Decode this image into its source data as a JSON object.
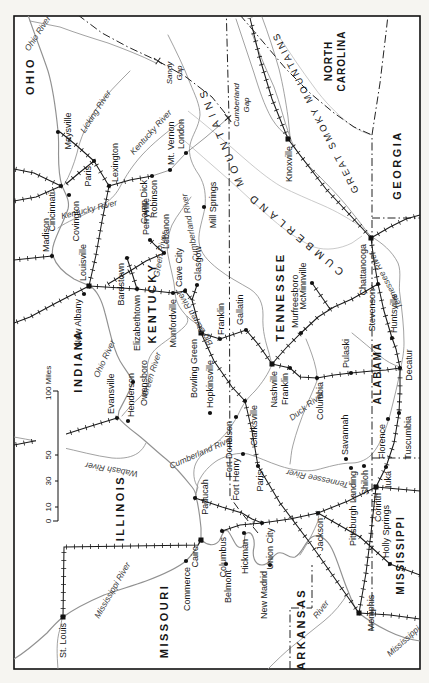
{
  "page": {
    "background": "#f6f5f1",
    "map_background": "#ffffff",
    "ink": "#1c1c1c",
    "river_ink": "#919191"
  },
  "states": {
    "ohio": "OHIO",
    "indiana": "INDIANA",
    "illinois": "ILLINOIS",
    "missouri": "MISSOURI",
    "arkansas": "ARKANSAS",
    "kentucky": "KENTUCKY",
    "tennessee": "TENNESSEE",
    "mississippi": "MISSISSIPPI",
    "alabama": "ALABAMA",
    "georgia": "GEORGIA",
    "north_carolina_1": "NORTH",
    "north_carolina_2": "CAROLINA"
  },
  "cities": {
    "st_louis": "St. Louis",
    "commerce": "Commerce",
    "cairo": "Cairo",
    "columbus": "Columbus",
    "belmont": "Belmont",
    "hickman": "Hickman",
    "union_city": "Union City",
    "new_madrid": "New Madrid",
    "paducah": "Paducah",
    "memphis": "Memphis",
    "fort_henry": "Fort Henry",
    "fort_donelson": "Fort Donelson",
    "paris_tn": "Paris",
    "jackson": "Jackson",
    "savannah": "Savannah",
    "pittsburgh_landing": "Pittsburgh Landing",
    "shiloh": "Shiloh",
    "corinth": "Corinth",
    "iuka": "Iuka",
    "holly_springs": "Holly Springs",
    "florence": "Florence",
    "tuscumbia": "Tuscumbia",
    "decatur": "Decatur",
    "huntsville": "Huntsville",
    "stevenson": "Stevenson",
    "chattanooga": "Chattanooga",
    "pulaski": "Pulaski",
    "columbia": "Columbia",
    "franklin_tn": "Franklin",
    "murfreesboro": "Murfreesboro",
    "mcminnville": "McMinnville",
    "nashville": "Nashville",
    "gallatin": "Gallatin",
    "franklin_ky": "Franklin",
    "clarksville": "Clarksville",
    "hopkinsville": "Hopkinsville",
    "bowling_green": "Bowling Green",
    "cave_city": "Cave City",
    "glasgow": "Glasgow",
    "munfordville": "Munfordville",
    "elizabethtown": "Elizabethtown",
    "louisville": "Louisville",
    "new_albany": "New Albany",
    "bardstown": "Bardstown",
    "perryville": "Perryville",
    "lebanon": "Lebanon",
    "owensboro": "Owensboro",
    "evansville": "Evansville",
    "henderson": "Henderson",
    "madison": "Madison",
    "cincinnati": "Cincinnati",
    "covington": "Covington",
    "maysville": "Maysville",
    "paris_ky": "Paris",
    "lexington": "Lexington",
    "camp_dick_1": "Camp Dick",
    "camp_dick_2": "Robinson",
    "mt_vernon": "Mt. Vernon",
    "london": "London",
    "mill_springs": "Mill Springs",
    "knoxville": "Knoxville"
  },
  "rivers": {
    "ohio_1": "Ohio River",
    "ohio_2": "Ohio River",
    "licking": "Licking River",
    "kentucky_1": "Kentucky River",
    "kentucky_2": "Kentucky River",
    "green_1": "Green River",
    "green_2": "Green River",
    "big_barren": "Big Barren River",
    "cumberland_1": "Cumberland River",
    "cumberland_2": "Cumberland River",
    "duck": "Duck River",
    "tennessee_1": "Tennessee River",
    "tennessee_2": "Tennessee River",
    "wabash": "Wabash River",
    "mississippi_upper": "Mississippi River",
    "mississippi_lower": "Mississippi",
    "arkansas_river": "River"
  },
  "mountains": {
    "cumberland_1": "CUMBERLAND",
    "cumberland_2": "MOUNTAINS",
    "great_smoky": "GREAT SMOKY MOUNTAINS"
  },
  "gaps": {
    "cumberland_1": "Cumberland",
    "cumberland_2": "Gap",
    "sandy_1": "Sandy",
    "sandy_2": "Gap"
  },
  "scale": {
    "t0": "0",
    "t10": "10",
    "t30": "30",
    "t50": "50",
    "end": "100 Miles"
  }
}
